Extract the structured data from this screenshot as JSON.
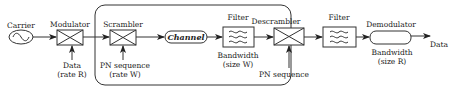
{
  "diagram": {
    "title": "",
    "colors": {
      "stroke": "#333333",
      "text": "#222222",
      "background": "#ffffff"
    },
    "blocks": [
      {
        "id": "carrier",
        "label": "Carrier",
        "icon": "sine-wave-icon"
      },
      {
        "id": "modulator",
        "label": "Modulator",
        "input_label_1": "Data",
        "input_label_2": "(rate R)",
        "icon": "cross-box-icon"
      },
      {
        "id": "scrambler",
        "label": "Scrambler",
        "input_label_1": "PN sequence",
        "input_label_2": "(rate W)",
        "icon": "cross-box-icon"
      },
      {
        "id": "channel",
        "label": "Channel"
      },
      {
        "id": "filter1",
        "label": "Filter",
        "sub_label_1": "Bandwidth",
        "sub_label_2": "(size W)",
        "icon": "filter-wave-icon"
      },
      {
        "id": "descrambler",
        "label": "Descrambler",
        "input_label_1": "PN sequence",
        "icon": "cross-box-icon"
      },
      {
        "id": "filter2",
        "label": "Filter",
        "icon": "filter-wave-icon"
      },
      {
        "id": "demodulator",
        "label": "Demodulator",
        "sub_label_1": "Bandwidth",
        "sub_label_2": "(size R)"
      }
    ],
    "output_label": "Data",
    "group": {
      "id": "spread-spectrum-section",
      "contains": [
        "scrambler",
        "channel",
        "filter1",
        "descrambler"
      ]
    }
  }
}
